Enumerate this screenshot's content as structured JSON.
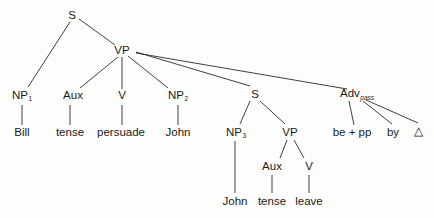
{
  "diagram": {
    "type": "syntax-tree",
    "nodes": {
      "s_root": {
        "label": "S",
        "x": 72,
        "y": 16
      },
      "vp": {
        "label": "VP",
        "x": 122,
        "y": 51
      },
      "np1": {
        "label": "NP",
        "sub": "1",
        "x": 22,
        "y": 96
      },
      "aux1": {
        "label": "Aux",
        "x": 73,
        "y": 96
      },
      "v1": {
        "label": "V",
        "x": 122,
        "y": 96
      },
      "np2": {
        "label": "NP",
        "sub": "2",
        "x": 178,
        "y": 96
      },
      "s_emb": {
        "label": "S",
        "x": 255,
        "y": 95
      },
      "adv": {
        "label": "Adv",
        "sub": "pass",
        "x": 357,
        "y": 95
      },
      "bill": {
        "label": "Bill",
        "x": 22,
        "y": 133
      },
      "tense1": {
        "label": "tense",
        "x": 70,
        "y": 133
      },
      "persuade": {
        "label": "persuade",
        "x": 121,
        "y": 133
      },
      "john1": {
        "label": "John",
        "x": 178,
        "y": 133
      },
      "np3": {
        "label": "NP",
        "sub": "3",
        "x": 236,
        "y": 133
      },
      "vp2": {
        "label": "VP",
        "x": 290,
        "y": 133
      },
      "bepp": {
        "label": "be + pp",
        "x": 352,
        "y": 133
      },
      "by": {
        "label": "by",
        "x": 393,
        "y": 133
      },
      "delta": {
        "label": "△",
        "x": 418,
        "y": 132
      },
      "aux2": {
        "label": "Aux",
        "x": 272,
        "y": 167
      },
      "v2": {
        "label": "V",
        "x": 309,
        "y": 167
      },
      "john2": {
        "label": "John",
        "x": 235,
        "y": 202
      },
      "tense2": {
        "label": "tense",
        "x": 272,
        "y": 202
      },
      "leave": {
        "label": "leave",
        "x": 309,
        "y": 202
      }
    },
    "edges": [
      [
        70,
        22,
        28,
        87
      ],
      [
        79,
        19,
        115,
        45
      ],
      [
        118,
        57,
        80,
        88
      ],
      [
        122,
        57,
        122,
        89
      ],
      [
        128,
        56,
        168,
        88
      ],
      [
        136,
        52,
        250,
        86
      ],
      [
        136,
        53,
        347,
        89
      ],
      [
        22,
        105,
        22,
        125
      ],
      [
        70,
        105,
        70,
        125
      ],
      [
        122,
        105,
        122,
        125
      ],
      [
        178,
        105,
        178,
        125
      ],
      [
        250,
        101,
        240,
        124
      ],
      [
        260,
        101,
        285,
        124
      ],
      [
        349,
        101,
        354,
        125
      ],
      [
        363,
        101,
        392,
        124
      ],
      [
        366,
        100,
        418,
        123
      ],
      [
        235,
        141,
        235,
        193
      ],
      [
        287,
        140,
        280,
        158
      ],
      [
        294,
        140,
        304,
        158
      ],
      [
        272,
        175,
        272,
        193
      ],
      [
        309,
        175,
        309,
        193
      ]
    ],
    "stroke": "#2a2a2a"
  }
}
